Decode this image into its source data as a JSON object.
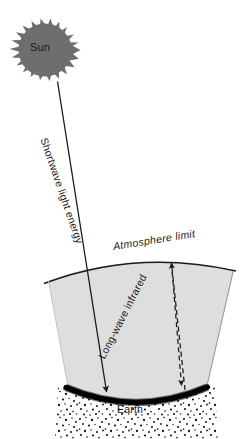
{
  "diagram": {
    "type": "schematic",
    "colors": {
      "background": "#ffffff",
      "sun_fill": "#6e6e6e",
      "atmosphere_fill": "#dedede",
      "stroke": "#1a1a1a",
      "earth_surface": "#000000",
      "text": "#1a1a1a"
    },
    "labels": {
      "sun": "Sun",
      "earth": "Earth",
      "atmosphere_limit": "Atmosphere limit",
      "shortwave": "Shortwave light energy",
      "longwave": "Long-wave infrared"
    },
    "elements": {
      "sun_icon": "sun-spiky-disc",
      "shortwave_arrow": "solid-arrow-downright",
      "longwave_up_arrow": "dashed-arrow-up",
      "longwave_down_arrow": "dashed-arrow-down",
      "atmosphere_arc": "curved-arc-line",
      "earth_arc": "thick-black-arc-with-stipple"
    }
  }
}
